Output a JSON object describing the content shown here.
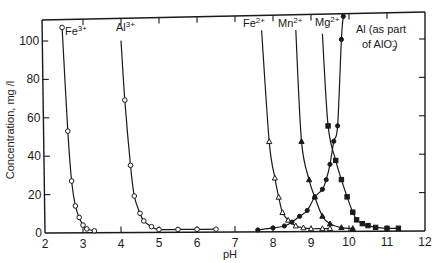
{
  "chart_data": {
    "type": "line",
    "title": "",
    "xlabel": "pH",
    "ylabel": "Concentration, mg /l",
    "xlim": [
      2,
      12
    ],
    "ylim": [
      0,
      110
    ],
    "x_ticks": [
      2,
      3,
      4,
      5,
      6,
      7,
      8,
      9,
      10,
      11,
      12
    ],
    "y_ticks": [
      0,
      20,
      40,
      60,
      80,
      100
    ],
    "grid": false,
    "legend": "inline labels at top of each curve",
    "series": [
      {
        "name": "Fe3+",
        "label_base": "Fe",
        "label_sup": "3+",
        "marker": "open-circle",
        "x": [
          2.45,
          2.6,
          2.7,
          2.8,
          2.9,
          3.0,
          3.1,
          3.3
        ],
        "y": [
          107,
          53,
          27,
          14,
          8,
          4,
          2,
          1
        ]
      },
      {
        "name": "Al3+",
        "label_base": "Al",
        "label_sup": "3+",
        "marker": "open-circle",
        "x": [
          4.1,
          4.25,
          4.35,
          4.5,
          4.6,
          4.8,
          5.0,
          5.5,
          6.0,
          6.5
        ],
        "y": [
          69,
          35,
          19,
          10,
          6,
          3,
          1.5,
          1.5,
          1.5,
          1.5
        ]
      },
      {
        "name": "Fe2+",
        "label_base": "Fe",
        "label_sup": "2+",
        "marker": "open-triangle",
        "x": [
          7.9,
          8.05,
          8.15,
          8.25,
          8.4,
          8.6,
          8.8,
          9.0,
          9.3,
          9.5
        ],
        "y": [
          47,
          28,
          18,
          10,
          6,
          3,
          2,
          1.5,
          1.5,
          1.5
        ]
      },
      {
        "name": "Mn2+",
        "label_base": "Mn",
        "label_sup": "2+",
        "marker": "filled-triangle",
        "x": [
          8.75,
          8.95,
          9.1,
          9.3,
          9.5,
          9.8,
          10.1
        ],
        "y": [
          47,
          27,
          18,
          8,
          4,
          2,
          1.5
        ]
      },
      {
        "name": "Mg2+",
        "label_base": "Mg",
        "label_sup": "2+",
        "marker": "filled-square",
        "x": [
          9.45,
          9.65,
          9.8,
          9.95,
          10.1,
          10.2,
          10.35,
          10.5,
          10.7,
          11.0,
          11.3
        ],
        "y": [
          55,
          37,
          27,
          18,
          10,
          6,
          4,
          3,
          2,
          1.5,
          1.5
        ]
      },
      {
        "name": "Al (as part of AlO2-)",
        "label_line1": "Al (as part",
        "label_line2": "of AlO2-)",
        "marker": "filled-circle",
        "x": [
          7.6,
          8.0,
          8.3,
          8.5,
          8.7,
          8.9,
          9.1,
          9.3,
          9.4,
          9.5,
          9.6,
          9.7,
          9.8,
          9.85
        ],
        "y": [
          1,
          2,
          3,
          5,
          8,
          11,
          18,
          22,
          27,
          35,
          47,
          55,
          100,
          112
        ]
      }
    ]
  },
  "axes": {
    "x_title": "pH",
    "y_title": "Concentration, mg /l",
    "x_tick_labels": [
      "2",
      "3",
      "4",
      "5",
      "6",
      "7",
      "8",
      "9",
      "10",
      "11",
      "12"
    ],
    "y_tick_labels": [
      "0",
      "20",
      "40",
      "60",
      "80",
      "100"
    ]
  },
  "labels": {
    "fe3": {
      "base": "Fe",
      "sup": "3+"
    },
    "al3": {
      "base": "Al",
      "sup": "3+"
    },
    "fe2": {
      "base": "Fe",
      "sup": "2+"
    },
    "mn2": {
      "base": "Mn",
      "sup": "2+"
    },
    "mg2": {
      "base": "Mg",
      "sup": "2+"
    },
    "alo2": {
      "line1": "Al (as part",
      "line2_prefix": "of AlO",
      "line2_sub": "2",
      "line2_sup": "-",
      "line2_suffix": ")"
    }
  }
}
